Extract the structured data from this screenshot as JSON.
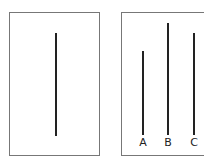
{
  "reference_card": {
    "line": {
      "length_px": 103
    }
  },
  "comparison_card": {
    "lines": [
      {
        "label": "A",
        "length_px": 84
      },
      {
        "label": "B",
        "length_px": 110
      },
      {
        "label": "C",
        "length_px": 101
      }
    ]
  },
  "colors": {
    "line": "#222222",
    "border": "#777777"
  }
}
